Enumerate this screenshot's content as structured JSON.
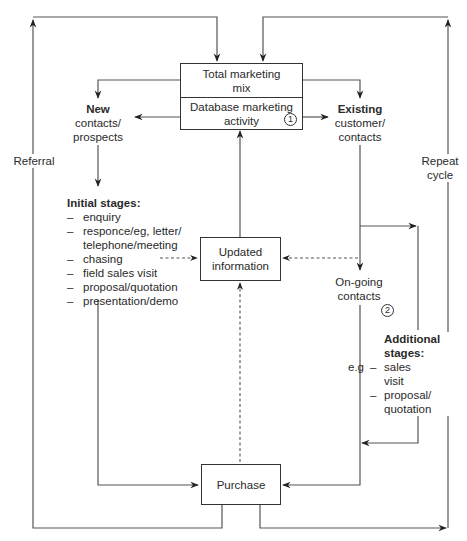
{
  "diagram": {
    "top_box": {
      "upper": "Total marketing mix",
      "upper_line1": "Total marketing",
      "upper_line2": "mix",
      "lower_line1": "Database marketing",
      "lower_line2": "activity",
      "marker": "1"
    },
    "updated_box": {
      "line1": "Updated",
      "line2": "information"
    },
    "purchase_box": {
      "label": "Purchase"
    },
    "new_contacts": {
      "title": "New",
      "line1": "contacts/",
      "line2": "prospects"
    },
    "existing_contacts": {
      "title": "Existing",
      "line1": "customer/",
      "line2": "contacts"
    },
    "referral_label": "Referral",
    "repeat_label": {
      "line1": "Repeat",
      "line2": "cycle"
    },
    "initial_stages": {
      "title": "Initial stages:",
      "dash": "–",
      "items": [
        "enquiry",
        "responce/eg, letter/",
        "telephone/meeting",
        "chasing",
        "field sales visit",
        "proposal/quotation",
        "presentation/demo"
      ]
    },
    "ongoing": {
      "line1": "On-going",
      "line2": "contacts",
      "marker": "2"
    },
    "additional_stages": {
      "title_line1": "Additional",
      "title_line2": "stages:",
      "prefix": "e.g",
      "dash": "–",
      "item1_line1": "sales",
      "item1_line2": "visit",
      "item2_line1": "proposal/",
      "item2_line2": "quotation"
    },
    "colors": {
      "line": "#555555",
      "box_border": "#333333",
      "text": "#2a2a2a"
    }
  }
}
